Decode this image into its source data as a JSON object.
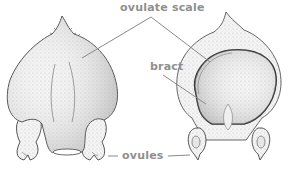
{
  "diagram": {
    "labels": {
      "ovulate_scale": "ovulate scale",
      "bract": "bract",
      "ovules": "ovules"
    },
    "views": [
      {
        "name": "abaxial-view",
        "description": "outer face of ovulate scale with two ovules at base"
      },
      {
        "name": "adaxial-view",
        "description": "inner face of ovulate scale showing bract and ovules"
      }
    ],
    "colors": {
      "label_text": "#8f8f8f",
      "leader_line": "#8a8a8a",
      "outline": "#444444",
      "stipple": "#bdbdbd"
    }
  }
}
